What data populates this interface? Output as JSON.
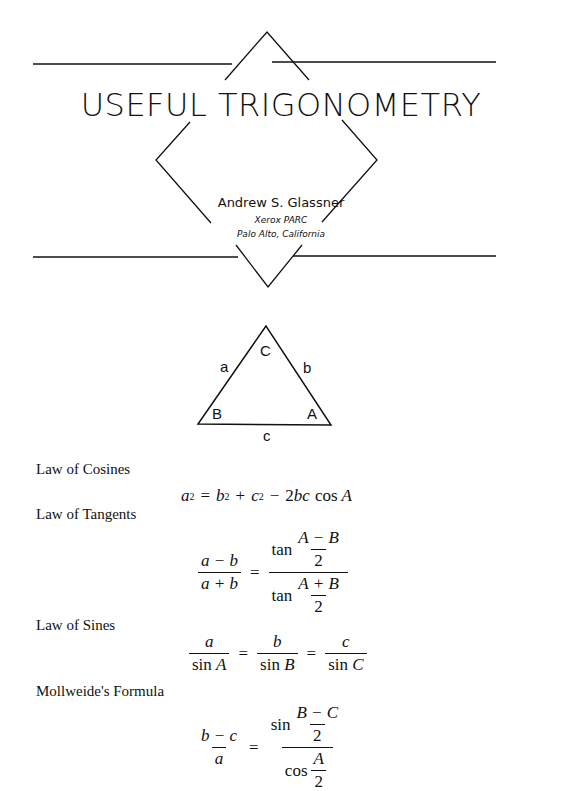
{
  "header": {
    "title": "USEFUL TRIGONOMETRY",
    "author": "Andrew S. Glassner",
    "affiliation": "Xerox PARC",
    "location": "Palo Alto, California"
  },
  "diagram": {
    "vertices": {
      "top": "C",
      "left": "B",
      "right": "A"
    },
    "sides": {
      "left": "a",
      "right": "b",
      "bottom": "c"
    }
  },
  "sections": [
    {
      "heading": "Law of Cosines",
      "formula": "a² = b² + c² − 2bc cos A"
    },
    {
      "heading": "Law of Tangents",
      "formula": "(a − b)/(a + b) = tan((A − B)/2) / tan((A + B)/2)"
    },
    {
      "heading": "Law of Sines",
      "formula": "a/sin A = b/sin B = c/sin C"
    },
    {
      "heading": "Mollweide's Formula",
      "formula": "(b − c)/a = sin((B − C)/2) / cos(A/2)"
    }
  ],
  "sym": {
    "a": "a",
    "b": "b",
    "c": "c",
    "A": "A",
    "B": "B",
    "C": "C",
    "two": "2",
    "eq": "=",
    "plus": "+",
    "minus": "−",
    "tan": "tan",
    "sin": "sin",
    "cos": "cos",
    "sq": "2",
    "twobc": "2bc",
    "a_minus_b": "a − b",
    "a_plus_b": "a + b",
    "A_minus_B": "A − B",
    "A_plus_B": "A + B",
    "b_minus_c": "b − c",
    "B_minus_C": "B − C"
  }
}
